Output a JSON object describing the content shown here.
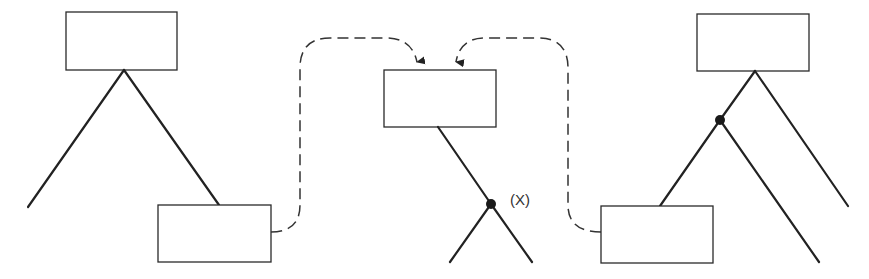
{
  "diagram": {
    "type": "tree-graft-illustration",
    "colors": {
      "stroke": "#222222",
      "background": "#ffffff"
    },
    "label_x": "(X)",
    "trees": [
      {
        "name": "left-tree",
        "boxes": 2,
        "nodes": 0
      },
      {
        "name": "middle-tree",
        "boxes": 1,
        "nodes": 1,
        "node_label": "(X)"
      },
      {
        "name": "right-tree",
        "boxes": 2,
        "nodes": 1
      }
    ],
    "connections": [
      {
        "from": "left-tree-bottom-box",
        "to": "middle-box",
        "style": "dashed-arrow"
      },
      {
        "from": "right-tree-bottom-box",
        "to": "middle-box",
        "style": "dashed-arrow"
      }
    ]
  }
}
